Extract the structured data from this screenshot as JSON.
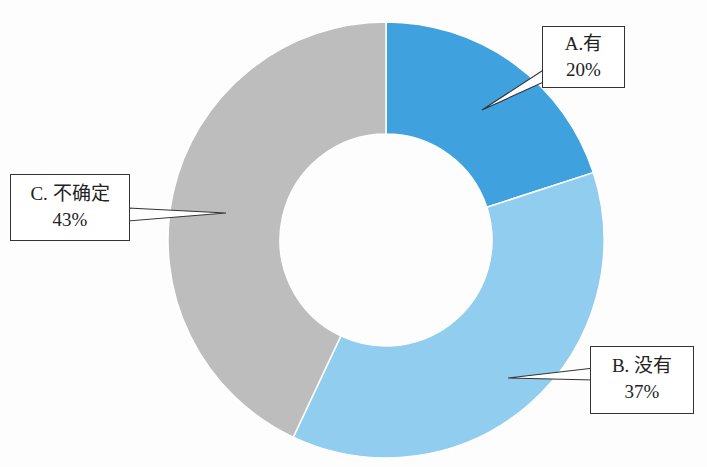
{
  "chart_data": {
    "type": "pie",
    "subtype": "donut",
    "title": "",
    "categories": [
      "A.有",
      "B. 没有",
      "C. 不确定"
    ],
    "values": [
      20,
      37,
      43
    ],
    "unit": "%",
    "colors": [
      "#3fa2de",
      "#90cdef",
      "#bdbdbd"
    ],
    "start_angle_deg": 0,
    "direction": "clockwise",
    "legend": "none",
    "labels": [
      {
        "name": "A.有",
        "value": "20%"
      },
      {
        "name": "B. 没有",
        "value": "37%"
      },
      {
        "name": "C. 不确定",
        "value": "43%"
      }
    ]
  }
}
